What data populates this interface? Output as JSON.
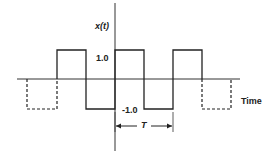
{
  "diagram": {
    "y_axis_label": "x(t)",
    "x_axis_label": "Time",
    "high_level_label": "1.0",
    "low_level_label": "-1.0",
    "period_label": "T",
    "colors": {
      "line": "#222222",
      "background": "#ffffff"
    }
  }
}
